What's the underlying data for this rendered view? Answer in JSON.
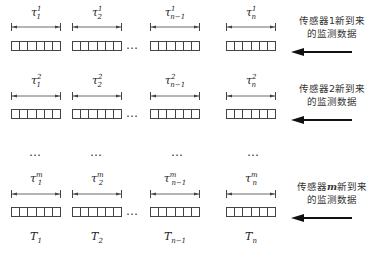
{
  "diagram": {
    "type": "sensor-data-buffer-windows",
    "column_x": [
      11,
      72,
      150,
      226
    ],
    "cells_per_block": 6,
    "rows": [
      {
        "id": "row-1",
        "sensor_index": "1",
        "tau_labels": [
          {
            "base": "τ",
            "sub": "1",
            "sup": "1"
          },
          {
            "base": "τ",
            "sub": "2",
            "sup": "1"
          },
          {
            "base": "τ",
            "sub": "n−1",
            "sup": "1"
          },
          {
            "base": "τ",
            "sub": "n",
            "sup": "1"
          }
        ],
        "label_line1": "传感器1新到来",
        "label_line2": "的监测数据",
        "tau_y": 6,
        "dim_y": 23,
        "cells_y": 41
      },
      {
        "id": "row-2",
        "sensor_index": "2",
        "tau_labels": [
          {
            "base": "τ",
            "sub": "1",
            "sup": "2"
          },
          {
            "base": "τ",
            "sub": "2",
            "sup": "2"
          },
          {
            "base": "τ",
            "sub": "n−1",
            "sup": "2"
          },
          {
            "base": "τ",
            "sub": "n",
            "sup": "2"
          }
        ],
        "label_line1": "传感器2新到来",
        "label_line2": "的监测数据",
        "tau_y": 74,
        "dim_y": 92,
        "cells_y": 109
      },
      {
        "id": "row-m",
        "sensor_index": "m",
        "tau_labels": [
          {
            "base": "τ",
            "sub": "1",
            "sup": "m"
          },
          {
            "base": "τ",
            "sub": "2",
            "sup": "m"
          },
          {
            "base": "τ",
            "sub": "n−1",
            "sup": "m"
          },
          {
            "base": "τ",
            "sub": "n",
            "sup": "m"
          }
        ],
        "label_line1_prefix": "传感器",
        "label_line1_var": "m",
        "label_line1_suffix": "新到来",
        "label_line2": "的监测数据",
        "tau_y": 172,
        "dim_y": 190,
        "cells_y": 207
      }
    ],
    "ellipsis": "…",
    "vertical_ellipsis_row": "…",
    "time_labels": [
      {
        "base": "T",
        "sub": "1"
      },
      {
        "base": "T",
        "sub": "2"
      },
      {
        "base": "T",
        "sub": "n−1"
      },
      {
        "base": "T",
        "sub": "n"
      }
    ],
    "colors": {
      "line": "#444444",
      "arrow": "#111111",
      "text": "#333333"
    }
  }
}
